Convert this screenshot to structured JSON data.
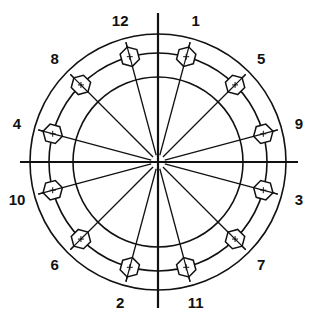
{
  "diagram": {
    "center": [
      158,
      162
    ],
    "colors": {
      "stroke": "#111111",
      "background": "#ffffff"
    },
    "axes": {
      "horizontal": {
        "x1": 20,
        "x2": 298,
        "y": 162
      },
      "vertical": {
        "x": 158,
        "y1": 13,
        "y2": 308
      }
    },
    "circles": [
      {
        "name": "outer-flange-edge",
        "r": 128
      },
      {
        "name": "bolt-circle",
        "r": 109
      },
      {
        "name": "inner-circle",
        "r": 85
      }
    ],
    "bolts": [
      {
        "label": "1",
        "angle": 15
      },
      {
        "label": "5",
        "angle": 45
      },
      {
        "label": "9",
        "angle": 75
      },
      {
        "label": "3",
        "angle": 105
      },
      {
        "label": "7",
        "angle": 135
      },
      {
        "label": "11",
        "angle": 165
      },
      {
        "label": "2",
        "angle": 195
      },
      {
        "label": "6",
        "angle": 225
      },
      {
        "label": "10",
        "angle": 255
      },
      {
        "label": "4",
        "angle": 285
      },
      {
        "label": "8",
        "angle": 315
      },
      {
        "label": "12",
        "angle": 345
      }
    ],
    "bolt_size": 10,
    "ray_end_r": 124,
    "label_r": 146
  }
}
